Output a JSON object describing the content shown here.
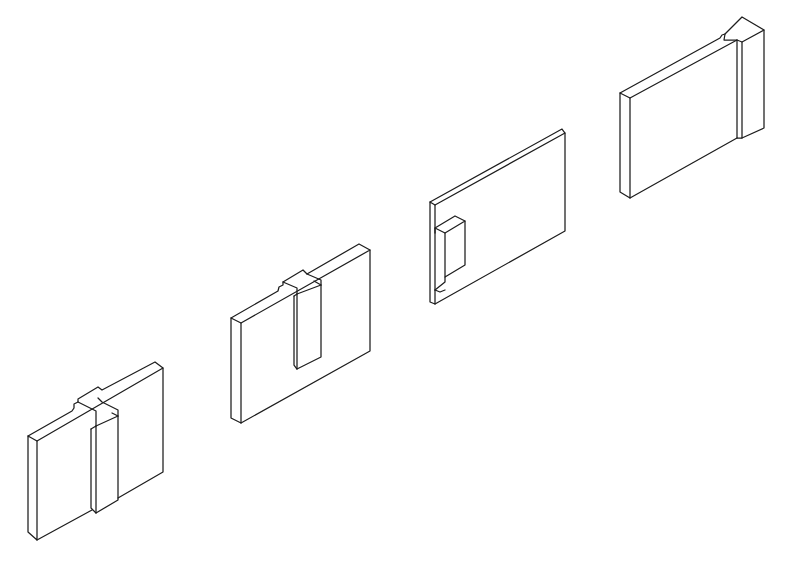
{
  "diagram": {
    "title": "",
    "background": "#ffffff",
    "stroke_color": "#1e1e1e",
    "pieces": [
      {
        "id": "piece-1",
        "name": "panel-with-full-height-tongue",
        "faces": [
          [
            [
              28,
              436
            ],
            [
              37,
              441
            ],
            [
              37,
              540
            ],
            [
              28,
              532
            ]
          ],
          [
            [
              37,
              441
            ],
            [
              163,
              368
            ],
            [
              163,
              472
            ],
            [
              118,
              498
            ],
            [
              118,
              500
            ],
            [
              96,
              513
            ],
            [
              96,
              518
            ],
            [
              37,
              540
            ]
          ]
        ],
        "lines": [
          [
            [
              28,
              436
            ],
            [
              37,
              441
            ],
            [
              37,
              540
            ],
            [
              28,
              532
            ],
            [
              28,
              436
            ]
          ],
          [
            [
              28,
              436
            ],
            [
              72,
              411
            ],
            [
              74,
              408
            ],
            [
              74,
              404
            ],
            [
              78,
              402
            ],
            [
              78,
              399
            ],
            [
              98,
              387
            ],
            [
              102,
              390
            ],
            [
              155,
              362
            ],
            [
              163,
              368
            ],
            [
              37,
              441
            ]
          ],
          [
            [
              163,
              368
            ],
            [
              163,
              472
            ],
            [
              118,
              498
            ]
          ],
          [
            [
              37,
              540
            ],
            [
              92,
              510
            ]
          ],
          [
            [
              91,
              429
            ],
            [
              91,
              508
            ],
            [
              96,
              513
            ],
            [
              118,
              500
            ],
            [
              118,
              416
            ]
          ],
          [
            [
              91,
              429
            ],
            [
              96,
              426
            ],
            [
              96,
              513
            ]
          ],
          [
            [
              96,
              426
            ],
            [
              118,
              416
            ],
            [
              112,
              413
            ]
          ],
          [
            [
              78,
              402
            ],
            [
              96,
              411
            ],
            [
              96,
              426
            ]
          ],
          [
            [
              118,
              416
            ],
            [
              118,
              410
            ],
            [
              102,
              402
            ],
            [
              98,
              398
            ]
          ]
        ]
      },
      {
        "id": "piece-2",
        "name": "panel-with-half-height-tongue",
        "faces": [
          [
            [
              231,
              318
            ],
            [
              241,
              323
            ],
            [
              241,
              423
            ],
            [
              231,
              418
            ]
          ],
          [
            [
              241,
              323
            ],
            [
              370,
              250
            ],
            [
              370,
              351
            ],
            [
              241,
              423
            ]
          ]
        ],
        "lines": [
          [
            [
              231,
              318
            ],
            [
              241,
              323
            ],
            [
              241,
              423
            ],
            [
              231,
              418
            ],
            [
              231,
              318
            ]
          ],
          [
            [
              231,
              318
            ],
            [
              278,
              291
            ],
            [
              279,
              287
            ],
            [
              283,
              285
            ],
            [
              283,
              282
            ],
            [
              303,
              270
            ],
            [
              307,
              274
            ],
            [
              359,
              244
            ],
            [
              370,
              250
            ],
            [
              241,
              323
            ]
          ],
          [
            [
              370,
              250
            ],
            [
              370,
              351
            ],
            [
              241,
              423
            ]
          ],
          [
            [
              294,
              296
            ],
            [
              294,
              365
            ],
            [
              297,
              369
            ],
            [
              321,
              357
            ],
            [
              321,
              285
            ]
          ],
          [
            [
              294,
              296
            ],
            [
              297,
              294
            ],
            [
              297,
              369
            ]
          ],
          [
            [
              297,
              294
            ],
            [
              321,
              285
            ],
            [
              314,
              281
            ]
          ],
          [
            [
              283,
              282
            ],
            [
              297,
              288
            ],
            [
              297,
              294
            ]
          ],
          [
            [
              321,
              285
            ],
            [
              321,
              280
            ],
            [
              307,
              274
            ]
          ]
        ]
      },
      {
        "id": "piece-3",
        "name": "panel-with-stub-tongue",
        "faces": [
          [
            [
              430,
              202
            ],
            [
              435,
              205
            ],
            [
              435,
              304
            ],
            [
              430,
              302
            ]
          ],
          [
            [
              435,
              205
            ],
            [
              565,
              133
            ],
            [
              565,
              231
            ],
            [
              435,
              304
            ]
          ]
        ],
        "lines": [
          [
            [
              430,
              202
            ],
            [
              435,
              205
            ],
            [
              435,
              304
            ],
            [
              430,
              302
            ],
            [
              430,
              202
            ]
          ],
          [
            [
              430,
              202
            ],
            [
              562,
              129
            ],
            [
              565,
              133
            ],
            [
              435,
              205
            ]
          ],
          [
            [
              565,
              133
            ],
            [
              565,
              231
            ],
            [
              435,
              304
            ]
          ],
          [
            [
              435,
              228
            ],
            [
              445,
              233
            ],
            [
              465,
              221
            ],
            [
              455,
              216
            ],
            [
              435,
              228
            ]
          ],
          [
            [
              445,
              233
            ],
            [
              445,
              277
            ],
            [
              465,
              265
            ],
            [
              465,
              221
            ]
          ],
          [
            [
              435,
              228
            ],
            [
              435,
              233
            ]
          ],
          [
            [
              435,
              290
            ],
            [
              445,
              282
            ],
            [
              445,
              277
            ]
          ],
          [
            [
              435,
              290
            ],
            [
              440,
              292
            ],
            [
              445,
              290
            ]
          ]
        ]
      },
      {
        "id": "piece-4",
        "name": "panel-with-end-block",
        "faces": [
          [
            [
              620,
              93
            ],
            [
              630,
              98
            ],
            [
              630,
              198
            ],
            [
              620,
              192
            ]
          ],
          [
            [
              630,
              98
            ],
            [
              737,
              40
            ],
            [
              737,
              138
            ],
            [
              630,
              198
            ]
          ],
          [
            [
              742,
              42
            ],
            [
              764,
              30
            ],
            [
              764,
              128
            ],
            [
              742,
              138
            ]
          ]
        ],
        "lines": [
          [
            [
              620,
              93
            ],
            [
              630,
              98
            ],
            [
              630,
              198
            ],
            [
              620,
              192
            ],
            [
              620,
              93
            ]
          ],
          [
            [
              620,
              93
            ],
            [
              720,
              38
            ],
            [
              722,
              35
            ],
            [
              725,
              34
            ],
            [
              742,
              17
            ],
            [
              764,
              30
            ],
            [
              742,
              42
            ],
            [
              737,
              40
            ],
            [
              630,
              98
            ]
          ],
          [
            [
              737,
              40
            ],
            [
              737,
              138
            ],
            [
              742,
              138
            ],
            [
              742,
              42
            ]
          ],
          [
            [
              764,
              30
            ],
            [
              764,
              128
            ],
            [
              742,
              138
            ]
          ],
          [
            [
              630,
              198
            ],
            [
              737,
              138
            ]
          ],
          [
            [
              725,
              34
            ],
            [
              724,
              40
            ],
            [
              737,
              40
            ]
          ]
        ]
      }
    ]
  }
}
